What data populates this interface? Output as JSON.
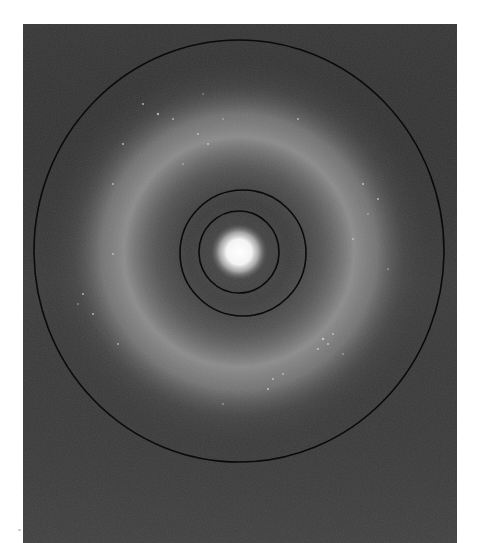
{
  "image": {
    "description": "Diffraction pattern photograph with bright central spot, diffuse halo ring, and three concentric calibration circles",
    "background_color": "#ffffff",
    "field_color": "#3b3b3b",
    "halo_color": "#9a9a9a",
    "center_spot_color": "#ffffff",
    "circle_line_color": "#0a0a0a",
    "center": {
      "x": 239,
      "y": 252
    },
    "circles": [
      {
        "name": "inner-ring",
        "rx": 40,
        "ry": 41
      },
      {
        "name": "middle-ring",
        "rx": 63,
        "ry": 63
      },
      {
        "name": "outer-ring",
        "rx": 205,
        "ry": 211
      }
    ],
    "halo_ring_radius": 125
  }
}
